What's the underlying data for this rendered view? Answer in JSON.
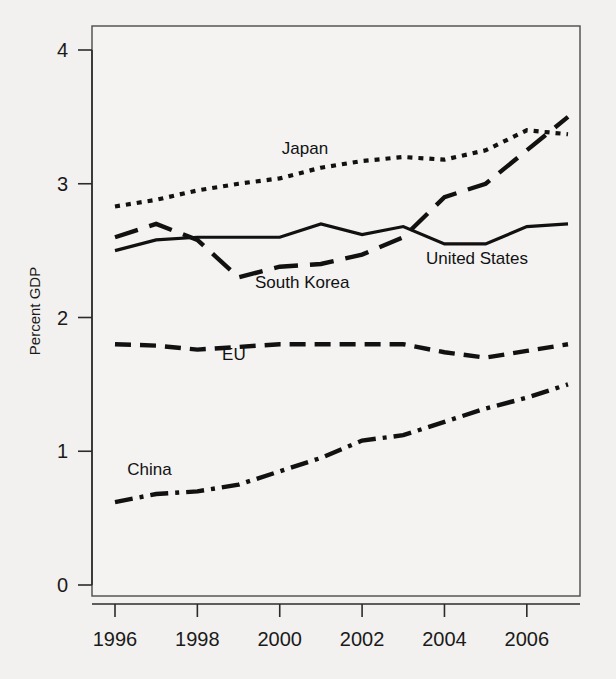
{
  "chart_data": {
    "type": "line",
    "title": "",
    "subtitle": "",
    "xlabel": "",
    "ylabel": "Percent GDP",
    "xlim": [
      1995.6,
      2007.4
    ],
    "ylim": [
      0,
      4.2
    ],
    "grid": false,
    "legend_position": "inline-labels",
    "x": [
      1996,
      1997,
      1998,
      1999,
      2000,
      2001,
      2002,
      2003,
      2004,
      2005,
      2006,
      2007
    ],
    "xticks": [
      1996,
      1998,
      2000,
      2002,
      2004,
      2006
    ],
    "xticklabels": [
      "1996",
      "1998",
      "2000",
      "2002",
      "2004",
      "2006"
    ],
    "yticks": [
      0,
      1,
      2,
      3,
      4
    ],
    "yticklabels": [
      "0",
      "1",
      "2",
      "3",
      "4"
    ],
    "series": [
      {
        "name": "Japan",
        "style": "dotted",
        "label_x": 2000.05,
        "label_y": 3.22,
        "values": [
          2.83,
          2.88,
          2.95,
          3.0,
          3.04,
          3.12,
          3.17,
          3.2,
          3.18,
          3.25,
          3.4,
          3.37
        ]
      },
      {
        "name": "United States",
        "style": "solid",
        "label_x": 2003.55,
        "label_y": 2.4,
        "values": [
          2.5,
          2.58,
          2.6,
          2.6,
          2.6,
          2.7,
          2.62,
          2.68,
          2.55,
          2.55,
          2.68,
          2.7
        ]
      },
      {
        "name": "South Korea",
        "style": "long-dash",
        "label_x": 1999.4,
        "label_y": 2.22,
        "values": [
          2.6,
          2.7,
          2.58,
          2.3,
          2.38,
          2.4,
          2.47,
          2.6,
          2.9,
          3.0,
          3.25,
          3.5
        ]
      },
      {
        "name": "EU",
        "style": "dash",
        "label_x": 1998.6,
        "label_y": 1.68,
        "values": [
          1.8,
          1.79,
          1.76,
          1.78,
          1.8,
          1.8,
          1.8,
          1.8,
          1.74,
          1.7,
          1.75,
          1.8
        ]
      },
      {
        "name": "China",
        "style": "dash-dot",
        "label_x": 1996.3,
        "label_y": 0.82,
        "values": [
          0.62,
          0.68,
          0.7,
          0.75,
          0.85,
          0.95,
          1.08,
          1.12,
          1.22,
          1.32,
          1.4,
          1.5
        ]
      }
    ]
  },
  "colors": {
    "ink": "#111111",
    "axis": "#2b2b2b",
    "background": "#f2f1ef",
    "plot_background": "#f4f3f1"
  }
}
